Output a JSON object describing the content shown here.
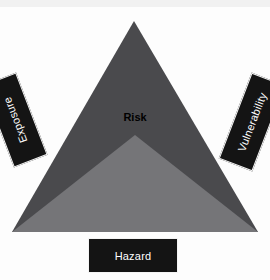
{
  "diagram": {
    "type": "risk-triangle",
    "background_color": "#fdfdfd",
    "center_label": "Risk",
    "center_label_color": "#000000",
    "shapes": {
      "upper_triangle": {
        "name": "risk-upper-triangle",
        "fill": "#4a4a4d",
        "points": "134,21 258,232 12,232"
      },
      "lower_triangle": {
        "name": "risk-lower-triangle",
        "fill": "#757578",
        "points": "135,135 258,232 12,232"
      }
    },
    "labels": [
      {
        "id": "exposure",
        "text": "Exposure",
        "box_color": "#141414",
        "text_color": "#ffffff",
        "rotation_deg": -21,
        "position": "left"
      },
      {
        "id": "vulnerability",
        "text": "Vulnerability",
        "box_color": "#141414",
        "text_color": "#ffffff",
        "rotation_deg": 21,
        "position": "right"
      },
      {
        "id": "hazard",
        "text": "Hazard",
        "box_color": "#141414",
        "text_color": "#ffffff",
        "rotation_deg": 0,
        "position": "bottom"
      }
    ]
  }
}
